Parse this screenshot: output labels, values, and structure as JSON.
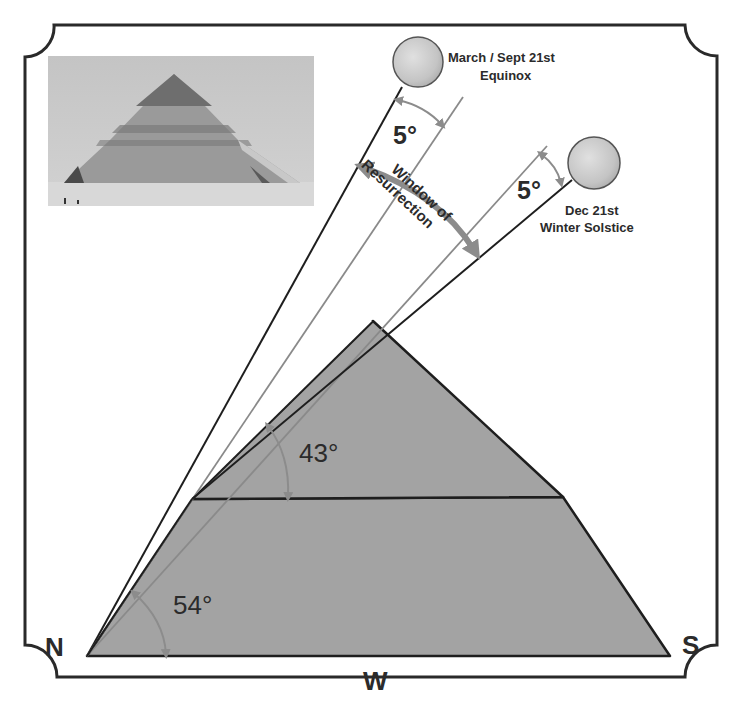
{
  "diagram": {
    "photo": {
      "alt": "Photograph of the Bent Pyramid"
    },
    "directions": {
      "north": "N",
      "south": "S",
      "west": "W"
    },
    "angles": {
      "lower_slope": "54°",
      "upper_slope": "43°",
      "equinox_offset": "5°",
      "solstice_offset": "5°"
    },
    "suns": {
      "equinox": {
        "line1": "March / Sept 21st",
        "line2": "Equinox"
      },
      "solstice": {
        "line1": "Dec 21st",
        "line2": "Winter Solstice"
      }
    },
    "window": {
      "line1": "Window of",
      "line2": "Resurrection"
    },
    "colors": {
      "pyramid_fill": "#a3a3a3",
      "outline": "#1e1e1e",
      "reference_line": "#8a8a8a",
      "arc_arrow": "#8c8c8c",
      "sun_fill": "#c9c9c9",
      "frame": "#2a2a2a"
    }
  }
}
